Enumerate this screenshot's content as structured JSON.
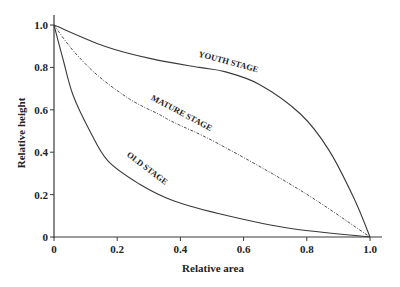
{
  "chart_data": {
    "type": "line",
    "title": "",
    "xlabel": "Relative area",
    "ylabel": "Relative height",
    "xlim": [
      0,
      1.0
    ],
    "ylim": [
      0,
      1.0
    ],
    "grid": false,
    "legend": "none (curves labeled inline)",
    "x_ticks": [
      "0",
      "0.2",
      "0.4",
      "0.6",
      "0.8",
      "1.0"
    ],
    "y_ticks": [
      "0",
      "0.2",
      "0.4",
      "0.6",
      "0.8",
      "1.0"
    ],
    "series": [
      {
        "name": "YOUTH STAGE",
        "style": "solid",
        "x": [
          0,
          0.16,
          0.31,
          0.46,
          0.54,
          0.65,
          0.78,
          0.87,
          0.95,
          1.0
        ],
        "y": [
          1.0,
          0.9,
          0.84,
          0.8,
          0.78,
          0.72,
          0.58,
          0.41,
          0.18,
          0
        ]
      },
      {
        "name": "MATURE STAGE",
        "style": "dash-dot",
        "x": [
          0,
          0.06,
          0.14,
          0.24,
          0.33,
          0.38,
          0.52,
          0.78,
          1.0
        ],
        "y": [
          1.0,
          0.88,
          0.76,
          0.65,
          0.58,
          0.54,
          0.44,
          0.22,
          0
        ]
      },
      {
        "name": "OLD STAGE",
        "style": "solid",
        "x": [
          0,
          0.03,
          0.06,
          0.11,
          0.17,
          0.27,
          0.38,
          0.55,
          0.75,
          1.0
        ],
        "y": [
          1.0,
          0.83,
          0.67,
          0.51,
          0.36,
          0.25,
          0.17,
          0.1,
          0.04,
          0
        ]
      }
    ],
    "annotations": [
      {
        "text": "YOUTH STAGE",
        "x": 0.55,
        "y": 0.8,
        "angle": 15
      },
      {
        "text": "MATURE STAGE",
        "x": 0.4,
        "y": 0.56,
        "angle": 28
      },
      {
        "text": "OLD STAGE",
        "x": 0.29,
        "y": 0.3,
        "angle": 37
      }
    ]
  },
  "colors": {
    "line": "#3a3a3a",
    "text": "#222222",
    "background": "#ffffff"
  }
}
